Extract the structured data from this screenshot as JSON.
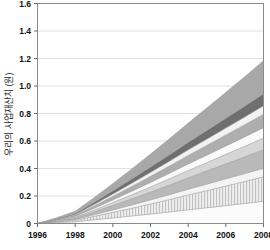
{
  "chart_data": {
    "type": "area",
    "title": "",
    "xlabel": "",
    "ylabel": "우리의 사업재산치 (원)",
    "xlim": [
      1996,
      2008
    ],
    "ylim": [
      0,
      1.6
    ],
    "xticks": [
      1996,
      1998,
      2000,
      2002,
      2004,
      2006,
      2008
    ],
    "yticks": [
      "0",
      "0.2",
      "0.4",
      "0.6",
      "0.8",
      "1.0",
      "1.2",
      "1.4",
      "1.6"
    ],
    "grid": true,
    "legend": "none",
    "stacked": true,
    "x": [
      1996,
      1997,
      1998,
      1999,
      2000,
      2001,
      2002,
      2003,
      2004,
      2005,
      2006,
      2007,
      2008
    ],
    "series": [
      {
        "name": "layer-1",
        "color": "#fbfbfb",
        "pattern": "solid",
        "values": [
          0.0,
          0.006,
          0.013,
          0.027,
          0.041,
          0.055,
          0.069,
          0.084,
          0.1,
          0.115,
          0.13,
          0.146,
          0.162
        ]
      },
      {
        "name": "layer-2",
        "color": "#e2e2e2",
        "pattern": "hatch-vertical",
        "values": [
          0.0,
          0.005,
          0.011,
          0.025,
          0.04,
          0.056,
          0.073,
          0.09,
          0.108,
          0.125,
          0.143,
          0.16,
          0.178
        ]
      },
      {
        "name": "layer-3",
        "color": "#f4f4f4",
        "pattern": "solid",
        "values": [
          0.0,
          0.003,
          0.006,
          0.012,
          0.018,
          0.024,
          0.03,
          0.036,
          0.042,
          0.047,
          0.052,
          0.057,
          0.062
        ]
      },
      {
        "name": "layer-4",
        "color": "#b9b9b9",
        "pattern": "solid",
        "values": [
          0.0,
          0.005,
          0.01,
          0.021,
          0.033,
          0.045,
          0.057,
          0.07,
          0.083,
          0.096,
          0.109,
          0.122,
          0.135
        ]
      },
      {
        "name": "layer-5",
        "color": "#d6d6d6",
        "pattern": "solid",
        "values": [
          0.0,
          0.003,
          0.007,
          0.014,
          0.021,
          0.029,
          0.037,
          0.045,
          0.053,
          0.061,
          0.069,
          0.077,
          0.085
        ]
      },
      {
        "name": "layer-6",
        "color": "#fafafa",
        "pattern": "solid",
        "values": [
          0.0,
          0.003,
          0.006,
          0.012,
          0.019,
          0.026,
          0.033,
          0.04,
          0.047,
          0.054,
          0.061,
          0.068,
          0.075
        ]
      },
      {
        "name": "layer-7",
        "color": "#aeaeae",
        "pattern": "solid",
        "values": [
          0.0,
          0.004,
          0.008,
          0.017,
          0.026,
          0.035,
          0.044,
          0.053,
          0.062,
          0.071,
          0.08,
          0.089,
          0.098
        ]
      },
      {
        "name": "layer-8",
        "color": "#f2f2f2",
        "pattern": "solid",
        "values": [
          0.0,
          0.002,
          0.005,
          0.011,
          0.017,
          0.023,
          0.029,
          0.035,
          0.041,
          0.046,
          0.051,
          0.056,
          0.061
        ]
      },
      {
        "name": "layer-9",
        "color": "#6f6f6f",
        "pattern": "solid",
        "values": [
          0.0,
          0.003,
          0.007,
          0.015,
          0.023,
          0.031,
          0.039,
          0.047,
          0.055,
          0.063,
          0.071,
          0.079,
          0.087
        ]
      },
      {
        "name": "layer-10",
        "color": "#a8a8a8",
        "pattern": "solid",
        "values": [
          0.0,
          0.008,
          0.016,
          0.034,
          0.053,
          0.073,
          0.094,
          0.116,
          0.139,
          0.163,
          0.188,
          0.214,
          0.241
        ]
      }
    ],
    "totals": [
      0.0,
      0.042,
      0.089,
      0.188,
      0.291,
      0.397,
      0.505,
      0.616,
      0.73,
      0.841,
      0.954,
      1.068,
      1.184
    ]
  },
  "axes": {
    "y_axis_title": "우리의 사업재산치 (원)"
  }
}
